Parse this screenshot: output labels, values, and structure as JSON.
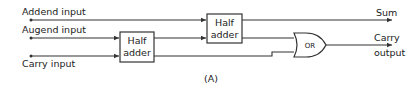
{
  "diagram": {
    "caption": "(A)",
    "inputs": [
      {
        "id": "addend",
        "label": "Addend input"
      },
      {
        "id": "augend",
        "label": "Augend input"
      },
      {
        "id": "carry",
        "label": "Carry input"
      }
    ],
    "blocks": [
      {
        "id": "ha1",
        "label_line1": "Half",
        "label_line2": "adder"
      },
      {
        "id": "ha2",
        "label_line1": "Half",
        "label_line2": "adder"
      },
      {
        "id": "or",
        "label": "OR"
      }
    ],
    "outputs": [
      {
        "id": "sum",
        "label": "Sum"
      },
      {
        "id": "carry_out",
        "label_line1": "Carry",
        "label_line2": "output"
      }
    ],
    "colors": {
      "line": "#333333",
      "background": "#ffffff"
    }
  }
}
